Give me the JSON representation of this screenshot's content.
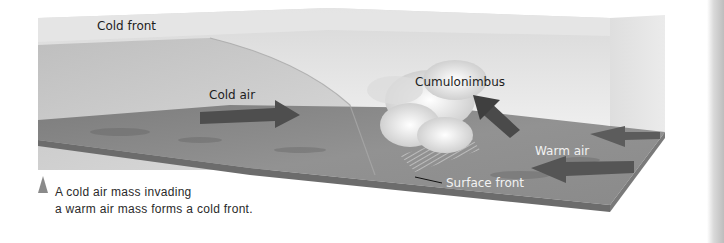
{
  "diagram": {
    "title_label": "Cold front",
    "labels": {
      "cold_air": "Cold air",
      "cumulonimbus": "Cumulonimbus",
      "warm_air": "Warm air",
      "surface_front": "Surface front"
    },
    "caption": {
      "line1": "A cold air mass invading",
      "line2": "a warm air mass forms a cold front."
    },
    "colors": {
      "sky_top": "#e9e9e9",
      "cold_air_mass": "#c9c9c9",
      "ground": "#8e8e8e",
      "ground_dark": "#6f6f6f",
      "arrow": "#5a5a5a",
      "cloud": "#f0f0f0",
      "caption_marker": "#8a8a8a"
    }
  }
}
